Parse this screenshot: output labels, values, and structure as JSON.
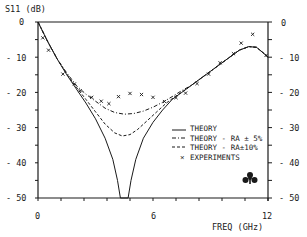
{
  "chart_data": {
    "type": "line",
    "title": "",
    "ylabel": "S11 (dB)",
    "xlabel": "FREQ (GHz)",
    "xlim": [
      0,
      12
    ],
    "ylim": [
      -50,
      0
    ],
    "x_tick_labels": [
      "0",
      "6",
      "12"
    ],
    "x_ticks_minor_step": 1.2,
    "y_tick_labels_left": [
      "0",
      "- 10",
      "- 20",
      "- 30",
      "- 40",
      "- 50"
    ],
    "y_tick_labels_right": [
      "0",
      "- 10",
      "- 20",
      "- 30",
      "- 40",
      "- 50"
    ],
    "y_ticks": [
      0,
      -10,
      -20,
      -30,
      -40,
      -50
    ],
    "grid": false,
    "legend_position": "lower-right inside",
    "series": [
      {
        "name": "THEORY",
        "style": "solid",
        "points": [
          [
            0,
            0
          ],
          [
            0.5,
            -5.5
          ],
          [
            1,
            -10.5
          ],
          [
            1.5,
            -15
          ],
          [
            2,
            -19
          ],
          [
            2.5,
            -23
          ],
          [
            3,
            -27.5
          ],
          [
            3.5,
            -33
          ],
          [
            3.9,
            -39
          ],
          [
            4.15,
            -45
          ],
          [
            4.3,
            -50
          ],
          [
            4.7,
            -50
          ],
          [
            4.85,
            -45
          ],
          [
            5.1,
            -39
          ],
          [
            5.5,
            -33
          ],
          [
            6,
            -28.5
          ],
          [
            6.5,
            -25
          ],
          [
            7,
            -22
          ],
          [
            7.5,
            -20
          ],
          [
            8,
            -18
          ],
          [
            8.5,
            -16
          ],
          [
            9,
            -14
          ],
          [
            9.5,
            -12
          ],
          [
            10,
            -10
          ],
          [
            10.5,
            -8
          ],
          [
            11,
            -7
          ],
          [
            11.4,
            -7.2
          ],
          [
            11.8,
            -9
          ],
          [
            12,
            -10
          ]
        ]
      },
      {
        "name": "THEORY - RA ± 5%",
        "style": "dash-dot",
        "points": [
          [
            0,
            0
          ],
          [
            0.5,
            -5.5
          ],
          [
            1,
            -10.5
          ],
          [
            1.5,
            -14.5
          ],
          [
            2,
            -18
          ],
          [
            2.5,
            -20.5
          ],
          [
            3,
            -22.5
          ],
          [
            3.5,
            -24.5
          ],
          [
            4,
            -25.7
          ],
          [
            4.5,
            -26.2
          ],
          [
            5,
            -26
          ],
          [
            5.5,
            -25.3
          ],
          [
            6,
            -24.2
          ],
          [
            6.5,
            -22.8
          ],
          [
            7,
            -21.2
          ],
          [
            7.5,
            -19.5
          ],
          [
            8,
            -18
          ],
          [
            8.5,
            -16
          ],
          [
            9,
            -14
          ],
          [
            9.5,
            -12
          ],
          [
            10,
            -10
          ],
          [
            10.5,
            -8
          ],
          [
            11,
            -7
          ],
          [
            11.4,
            -7.2
          ],
          [
            11.8,
            -9
          ],
          [
            12,
            -10
          ]
        ]
      },
      {
        "name": "THEORY - RA±10%",
        "style": "dashed",
        "points": [
          [
            0,
            0
          ],
          [
            0.5,
            -5.5
          ],
          [
            1,
            -10.5
          ],
          [
            1.5,
            -14.8
          ],
          [
            2,
            -18.5
          ],
          [
            2.5,
            -22
          ],
          [
            3,
            -25.5
          ],
          [
            3.5,
            -29
          ],
          [
            4,
            -31.5
          ],
          [
            4.4,
            -32.4
          ],
          [
            4.8,
            -32
          ],
          [
            5.2,
            -30.5
          ],
          [
            5.7,
            -28
          ],
          [
            6.2,
            -25.5
          ],
          [
            6.7,
            -23
          ],
          [
            7.2,
            -21
          ],
          [
            7.7,
            -19.2
          ],
          [
            8,
            -18
          ],
          [
            8.5,
            -16
          ],
          [
            9,
            -14
          ],
          [
            9.5,
            -12
          ],
          [
            10,
            -10
          ],
          [
            10.5,
            -8
          ],
          [
            11,
            -7
          ],
          [
            11.4,
            -7.2
          ],
          [
            11.8,
            -9
          ],
          [
            12,
            -10
          ]
        ]
      },
      {
        "name": "EXPERIMENTS",
        "style": "markers-x",
        "points": [
          [
            0.25,
            -4.5
          ],
          [
            0.55,
            -8
          ],
          [
            1.3,
            -14.8
          ],
          [
            1.9,
            -17.6
          ],
          [
            2.2,
            -19.5
          ],
          [
            2.8,
            -21.4
          ],
          [
            3.3,
            -22.5
          ],
          [
            3.7,
            -23.2
          ],
          [
            4.2,
            -21.2
          ],
          [
            4.8,
            -20.3
          ],
          [
            5.4,
            -20.6
          ],
          [
            6.0,
            -21.4
          ],
          [
            6.6,
            -22.6
          ],
          [
            7.2,
            -21.5
          ],
          [
            7.7,
            -20.2
          ],
          [
            8.3,
            -17.5
          ],
          [
            8.9,
            -14.8
          ],
          [
            9.5,
            -11.6
          ],
          [
            10.2,
            -9
          ],
          [
            10.6,
            -6
          ],
          [
            11.2,
            -3.5
          ],
          [
            11.9,
            -9.5
          ]
        ]
      }
    ],
    "legend": [
      "THEORY",
      "THEORY - RA ± 5%",
      "THEORY - RA±10%",
      "EXPERIMENTS"
    ],
    "annotations": [
      "trefoil logo mark (lower right)"
    ]
  },
  "labels": {
    "ylabel": "S11 (dB)",
    "xlabel": "FREQ (GHz)",
    "x0": "0",
    "x6": "6",
    "x12": "12",
    "yl0": "0",
    "yl10": "- 10",
    "yl20": "- 20",
    "yl30": "- 30",
    "yl40": "- 40",
    "yl50": "- 50",
    "yr0": "0",
    "yr10": "- 10",
    "yr20": "- 20",
    "yr30": "- 30",
    "yr40": "- 40",
    "yr50": "- 50",
    "leg0": "THEORY",
    "leg1": "THEORY - RA ± 5%",
    "leg2": "THEORY - RA±10%",
    "leg3": "EXPERIMENTS"
  },
  "colors": {
    "ink": "#1a1a1a",
    "background": "#ffffff"
  }
}
